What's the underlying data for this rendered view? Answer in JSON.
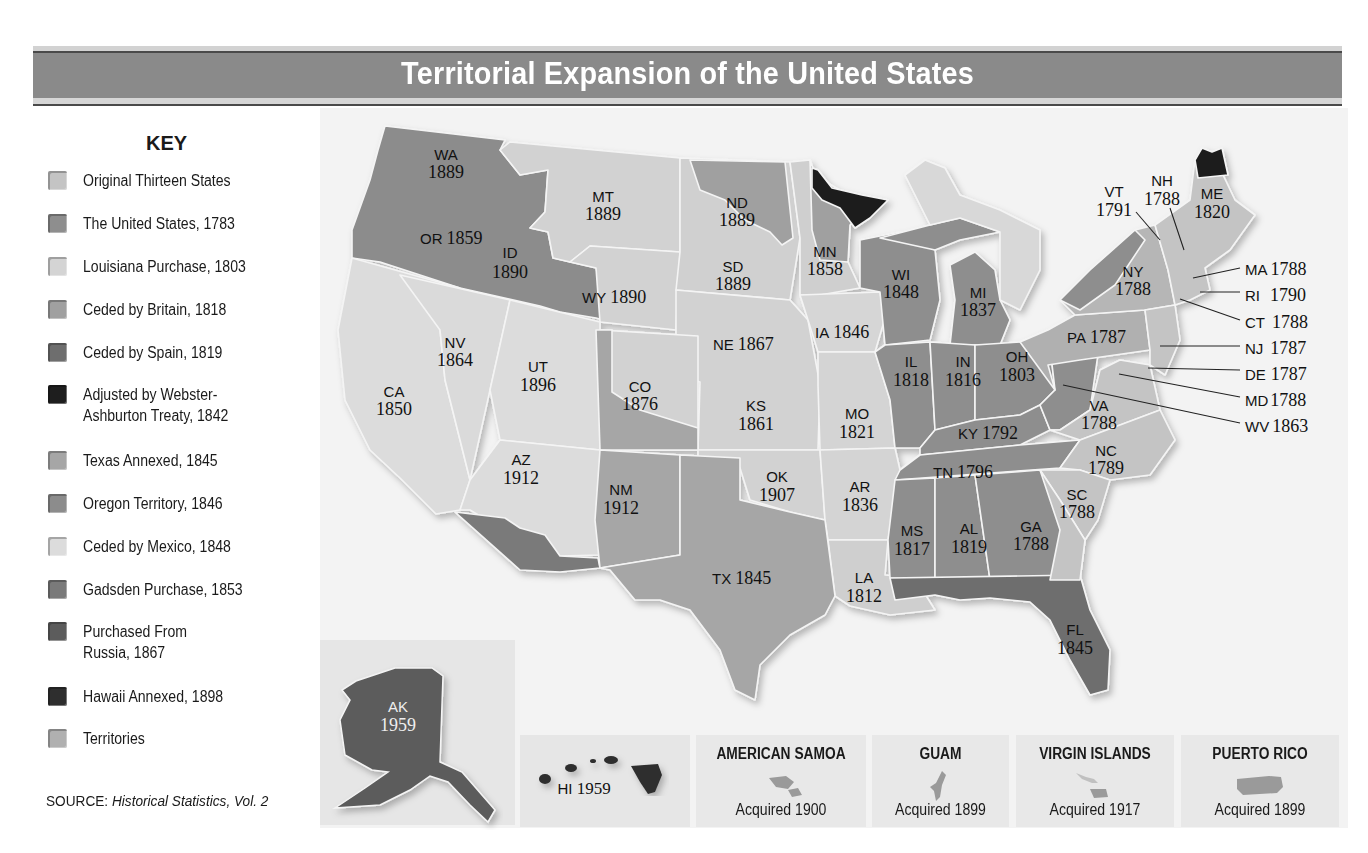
{
  "title": "Territorial Expansion of the United States",
  "colors": {
    "original_thirteen": "#c4c4c4",
    "us_1783": "#8e8e8e",
    "louisiana": "#d4d4d4",
    "britain_1818": "#a0a0a0",
    "spain_1819": "#6e6e6e",
    "webster_ashburton": "#1e1e1e",
    "texas": "#a6a6a6",
    "oregon": "#8c8c8c",
    "mexico": "#dcdcdc",
    "gadsden": "#7a7a7a",
    "russia": "#5c5c5c",
    "hawaii": "#2e2e2e",
    "territories": "#b0b0b0",
    "title_bar": "#8a8a8a",
    "map_bg": "#f3f3f3"
  },
  "key": {
    "title": "KEY",
    "items": [
      {
        "label": "Original Thirteen States",
        "color": "#c4c4c4"
      },
      {
        "label": "The United States, 1783",
        "color": "#8e8e8e"
      },
      {
        "label": "Louisiana Purchase, 1803",
        "color": "#d4d4d4"
      },
      {
        "label": "Ceded by Britain, 1818",
        "color": "#a0a0a0"
      },
      {
        "label": "Ceded by Spain, 1819",
        "color": "#6e6e6e"
      },
      {
        "label": "Adjusted by Webster-",
        "label2": "Ashburton Treaty, 1842",
        "color": "#1e1e1e"
      },
      {
        "label": "Texas Annexed, 1845",
        "color": "#a6a6a6"
      },
      {
        "label": "Oregon Territory, 1846",
        "color": "#8c8c8c"
      },
      {
        "label": "Ceded by Mexico, 1848",
        "color": "#dcdcdc"
      },
      {
        "label": "Gadsden Purchase, 1853",
        "color": "#7a7a7a"
      },
      {
        "label": "Purchased From",
        "label2": "Russia, 1867",
        "color": "#5c5c5c"
      },
      {
        "label": "Hawaii Annexed, 1898",
        "color": "#2e2e2e"
      },
      {
        "label": "Territories",
        "color": "#b0b0b0"
      }
    ]
  },
  "source": {
    "prefix": "SOURCE: ",
    "work": "Historical Statistics, Vol. 2"
  },
  "states": {
    "WA": {
      "abbr": "WA",
      "year": "1889"
    },
    "OR": {
      "abbr": "OR",
      "year": "1859"
    },
    "ID": {
      "abbr": "ID",
      "year": "1890"
    },
    "MT": {
      "abbr": "MT",
      "year": "1889"
    },
    "WY": {
      "abbr": "WY",
      "year": "1890"
    },
    "ND": {
      "abbr": "ND",
      "year": "1889"
    },
    "SD": {
      "abbr": "SD",
      "year": "1889"
    },
    "MN": {
      "abbr": "MN",
      "year": "1858"
    },
    "WI": {
      "abbr": "WI",
      "year": "1848"
    },
    "MI": {
      "abbr": "MI",
      "year": "1837"
    },
    "NV": {
      "abbr": "NV",
      "year": "1864"
    },
    "CA": {
      "abbr": "CA",
      "year": "1850"
    },
    "UT": {
      "abbr": "UT",
      "year": "1896"
    },
    "CO": {
      "abbr": "CO",
      "year": "1876"
    },
    "NE": {
      "abbr": "NE",
      "year": "1867"
    },
    "IA": {
      "abbr": "IA",
      "year": "1846"
    },
    "KS": {
      "abbr": "KS",
      "year": "1861"
    },
    "MO": {
      "abbr": "MO",
      "year": "1821"
    },
    "IL": {
      "abbr": "IL",
      "year": "1818"
    },
    "IN": {
      "abbr": "IN",
      "year": "1816"
    },
    "OH": {
      "abbr": "OH",
      "year": "1803"
    },
    "KY": {
      "abbr": "KY",
      "year": "1792"
    },
    "TN": {
      "abbr": "TN",
      "year": "1796"
    },
    "AZ": {
      "abbr": "AZ",
      "year": "1912"
    },
    "NM": {
      "abbr": "NM",
      "year": "1912"
    },
    "OK": {
      "abbr": "OK",
      "year": "1907"
    },
    "AR": {
      "abbr": "AR",
      "year": "1836"
    },
    "TX": {
      "abbr": "TX",
      "year": "1845"
    },
    "LA": {
      "abbr": "LA",
      "year": "1812"
    },
    "MS": {
      "abbr": "MS",
      "year": "1817"
    },
    "AL": {
      "abbr": "AL",
      "year": "1819"
    },
    "GA": {
      "abbr": "GA",
      "year": "1788"
    },
    "FL": {
      "abbr": "FL",
      "year": "1845"
    },
    "SC": {
      "abbr": "SC",
      "year": "1788"
    },
    "NC": {
      "abbr": "NC",
      "year": "1789"
    },
    "VA": {
      "abbr": "VA",
      "year": "1788"
    },
    "PA": {
      "abbr": "PA",
      "year": "1787"
    },
    "NY": {
      "abbr": "NY",
      "year": "1788"
    },
    "VT": {
      "abbr": "VT",
      "year": "1791"
    },
    "NH": {
      "abbr": "NH",
      "year": "1788"
    },
    "ME": {
      "abbr": "ME",
      "year": "1820"
    },
    "AK": {
      "abbr": "AK",
      "year": "1959"
    },
    "HI": {
      "abbr": "HI",
      "year": "1959"
    }
  },
  "callouts": [
    {
      "abbr": "MA",
      "year": "1788"
    },
    {
      "abbr": "RI",
      "year": "1790"
    },
    {
      "abbr": "CT",
      "year": "1788"
    },
    {
      "abbr": "NJ",
      "year": "1787"
    },
    {
      "abbr": "DE",
      "year": "1787"
    },
    {
      "abbr": "MD",
      "year": "1788"
    },
    {
      "abbr": "WV",
      "year": "1863"
    }
  ],
  "territories": [
    {
      "name": "AMERICAN SAMOA",
      "acquired": "Acquired 1900"
    },
    {
      "name": "GUAM",
      "acquired": "Acquired 1899"
    },
    {
      "name": "VIRGIN ISLANDS",
      "acquired": "Acquired 1917"
    },
    {
      "name": "PUERTO RICO",
      "acquired": "Acquired 1899"
    }
  ]
}
